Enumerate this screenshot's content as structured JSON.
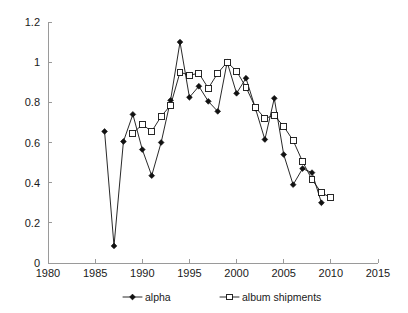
{
  "chart_data": {
    "type": "line",
    "title": "",
    "subtitle": "",
    "xlabel": "",
    "ylabel": "",
    "xlim": [
      1980,
      2015
    ],
    "ylim": [
      0,
      1.2
    ],
    "xticks": [
      1980,
      1985,
      1990,
      1995,
      2000,
      2005,
      2010,
      2015
    ],
    "xtick_labels": [
      "1980",
      "1985",
      "1990",
      "1995",
      "2000",
      "2005",
      "2010",
      "2015"
    ],
    "yticks": [
      0,
      0.2,
      0.4,
      0.6,
      0.8,
      1,
      1.2
    ],
    "ytick_labels": [
      "0",
      "0.2",
      "0.4",
      "0.6",
      "0.8",
      "1",
      "1.2"
    ],
    "grid": false,
    "legend_position": "bottom",
    "series": [
      {
        "name": "alpha",
        "marker": "filled-diamond",
        "x": [
          1986,
          1987,
          1988,
          1989,
          1990,
          1991,
          1992,
          1993,
          1994,
          1995,
          1996,
          1997,
          1998,
          1999,
          2000,
          2001,
          2002,
          2003,
          2004,
          2005,
          2006,
          2007,
          2008,
          2009
        ],
        "values": [
          0.655,
          0.085,
          0.605,
          0.74,
          0.565,
          0.435,
          0.6,
          0.81,
          1.1,
          0.825,
          0.88,
          0.805,
          0.755,
          1.0,
          0.845,
          0.92,
          0.77,
          0.615,
          0.82,
          0.54,
          0.39,
          0.47,
          0.45,
          0.3
        ]
      },
      {
        "name": "album shipments",
        "marker": "open-square",
        "x": [
          1989,
          1990,
          1991,
          1992,
          1993,
          1994,
          1995,
          1996,
          1997,
          1998,
          1999,
          2000,
          2001,
          2002,
          2003,
          2004,
          2005,
          2006,
          2007,
          2008,
          2009,
          2010
        ],
        "values": [
          0.645,
          0.69,
          0.655,
          0.73,
          0.785,
          0.95,
          0.935,
          0.945,
          0.87,
          0.945,
          1.0,
          0.955,
          0.875,
          0.775,
          0.72,
          0.735,
          0.68,
          0.61,
          0.505,
          0.415,
          0.35,
          0.325
        ]
      }
    ]
  },
  "legend": {
    "items": [
      {
        "label": "alpha"
      },
      {
        "label": "album shipments"
      }
    ]
  }
}
